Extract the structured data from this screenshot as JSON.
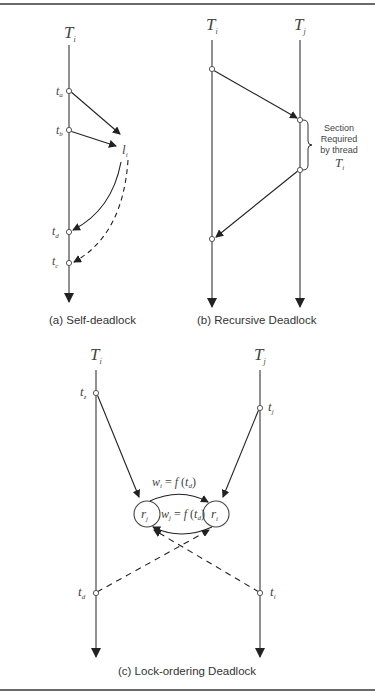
{
  "figure": {
    "panels": [
      {
        "id": "a",
        "caption": "(a) Self-deadlock",
        "thread_label": "T",
        "thread_sub": "i",
        "time_labels": [
          {
            "t": "t",
            "sub": "a"
          },
          {
            "t": "t",
            "sub": "b"
          },
          {
            "t": "t",
            "sub": "d"
          },
          {
            "t": "t",
            "sub": "c"
          }
        ],
        "lock_label": {
          "t": "l",
          "sub": "i"
        }
      },
      {
        "id": "b",
        "caption": "(b) Recursive Deadlock",
        "threads": [
          {
            "label": "T",
            "sub": "i"
          },
          {
            "label": "T",
            "sub": "j"
          }
        ],
        "annotation": {
          "line1": "Section",
          "line2": "Required",
          "line3": "by thread",
          "thread": "T",
          "thread_sub": "i"
        }
      },
      {
        "id": "c",
        "caption": "(c) Lock-ordering Deadlock",
        "threads": [
          {
            "label": "T",
            "sub": "i"
          },
          {
            "label": "T",
            "sub": "j"
          }
        ],
        "time_labels": [
          {
            "t": "t",
            "sub": "z"
          },
          {
            "t": "t",
            "sub": "j"
          },
          {
            "t": "t",
            "sub": "d"
          },
          {
            "t": "t",
            "sub": "i"
          }
        ],
        "resources": [
          {
            "r": "r",
            "sub": "j"
          },
          {
            "r": "r",
            "sub": "i"
          }
        ],
        "edge_labels": [
          {
            "w": "w",
            "w_sub": "i",
            "eq": " = ",
            "f": "f",
            "arg": "t",
            "arg_sub": "d"
          },
          {
            "w": "w",
            "w_sub": "j",
            "eq": " = ",
            "f": "f",
            "arg": "t",
            "arg_sub": "d"
          }
        ]
      }
    ]
  }
}
